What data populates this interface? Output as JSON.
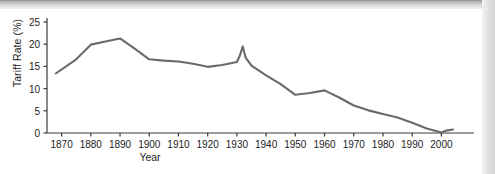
{
  "figure": {
    "axis_color": "#3a3a3a",
    "line_color": "#6a6a6a",
    "text_color": "#1c1c1c"
  },
  "chart_data": {
    "type": "line",
    "title": "",
    "xlabel": "Year",
    "ylabel": "Tariff Rate (%)",
    "xlim": [
      1865,
      2005
    ],
    "ylim": [
      0,
      25
    ],
    "grid": false,
    "legend": "none",
    "x_ticks": [
      1870,
      1880,
      1890,
      1900,
      1910,
      1920,
      1930,
      1940,
      1950,
      1960,
      1970,
      1980,
      1990,
      2000
    ],
    "x_tick_labels": [
      "1870",
      "1880",
      "1890",
      "1900",
      "1910",
      "1920",
      "1930",
      "1940",
      "1950",
      "1960",
      "1970",
      "1980",
      "1990",
      "2000"
    ],
    "y_ticks": [
      0,
      5,
      10,
      15,
      20,
      25
    ],
    "y_tick_labels": [
      "0",
      "5",
      "10",
      "15",
      "20",
      "25"
    ],
    "series": [
      {
        "name": "Tariff Rate",
        "x": [
          1868,
          1875,
          1880,
          1885,
          1890,
          1895,
          1900,
          1905,
          1910,
          1915,
          1920,
          1925,
          1930,
          1931,
          1932,
          1933,
          1935,
          1940,
          1945,
          1950,
          1955,
          1960,
          1965,
          1970,
          1975,
          1980,
          1985,
          1990,
          1995,
          2000,
          2002,
          2004
        ],
        "y": [
          13.4,
          16.6,
          19.9,
          20.6,
          21.3,
          19.0,
          16.6,
          16.3,
          16.1,
          15.6,
          14.9,
          15.3,
          16.0,
          17.4,
          19.5,
          17.0,
          15.2,
          13.0,
          11.0,
          8.6,
          9.0,
          9.6,
          8.0,
          6.2,
          5.1,
          4.3,
          3.5,
          2.3,
          1.0,
          0.1,
          0.6,
          0.8
        ]
      }
    ]
  }
}
